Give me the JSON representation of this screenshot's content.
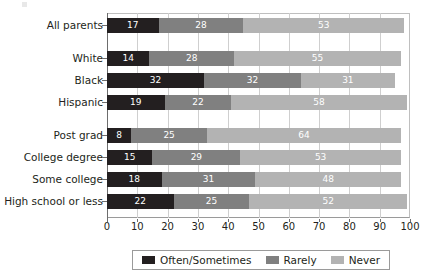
{
  "chart_data": {
    "type": "bar",
    "orientation": "horizontal",
    "stacked": true,
    "title": "",
    "subtitle": "",
    "xlabel": "",
    "ylabel": "",
    "xlim": [
      0,
      100
    ],
    "xticks": [
      0,
      10,
      20,
      30,
      40,
      50,
      60,
      70,
      80,
      90,
      100
    ],
    "grid": true,
    "grid_axis": "x",
    "legend_position": "bottom",
    "categories": [
      "All parents",
      "White",
      "Black",
      "Hispanic",
      "Post grad",
      "College degree",
      "Some college",
      "High school or less"
    ],
    "group_breaks_after": [
      "All parents",
      "Hispanic"
    ],
    "series": [
      {
        "name": "Often/Sometimes",
        "color": "#231f20",
        "values": [
          17,
          14,
          32,
          19,
          8,
          15,
          18,
          22
        ]
      },
      {
        "name": "Rarely",
        "color": "#808080",
        "values": [
          28,
          28,
          32,
          22,
          25,
          29,
          31,
          25
        ]
      },
      {
        "name": "Never",
        "color": "#b3b3b3",
        "values": [
          53,
          55,
          31,
          58,
          64,
          53,
          48,
          52
        ]
      }
    ]
  },
  "legend": {
    "items": [
      {
        "label": "Often/Sometimes",
        "color": "#231f20"
      },
      {
        "label": "Rarely",
        "color": "#808080"
      },
      {
        "label": "Never",
        "color": "#b3b3b3"
      }
    ]
  }
}
